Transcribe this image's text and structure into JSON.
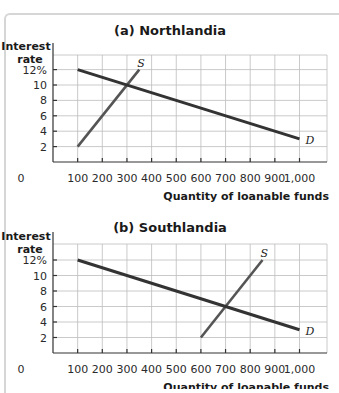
{
  "chart_data": [
    {
      "type": "line",
      "title": "(a) Northlandia",
      "xlabel": "Quantity of loanable funds",
      "ylabel": "Interest rate",
      "xlim": [
        0,
        1050
      ],
      "ylim": [
        0,
        14
      ],
      "x_ticks": [
        "0",
        "100",
        "200",
        "300",
        "400",
        "500",
        "600",
        "700",
        "800",
        "900",
        "1,000"
      ],
      "y_ticks": [
        "2",
        "4",
        "6",
        "8",
        "10",
        "12%"
      ],
      "grid": true,
      "series": [
        {
          "name": "S",
          "label": "S",
          "points": [
            [
              100,
              2
            ],
            [
              350,
              12
            ]
          ],
          "color": "#555555"
        },
        {
          "name": "D",
          "label": "D",
          "points": [
            [
              100,
              12
            ],
            [
              1000,
              3
            ]
          ],
          "color": "#333333"
        }
      ],
      "equilibrium": {
        "x": 300,
        "y": 10
      }
    },
    {
      "type": "line",
      "title": "(b) Southlandia",
      "xlabel": "Quantity of loanable funds",
      "ylabel": "Interest rate",
      "xlim": [
        0,
        1050
      ],
      "ylim": [
        0,
        14
      ],
      "x_ticks": [
        "0",
        "100",
        "200",
        "300",
        "400",
        "500",
        "600",
        "700",
        "800",
        "900",
        "1,000"
      ],
      "y_ticks": [
        "2",
        "4",
        "6",
        "8",
        "10",
        "12%"
      ],
      "grid": true,
      "series": [
        {
          "name": "S",
          "label": "S",
          "points": [
            [
              600,
              2
            ],
            [
              850,
              12
            ]
          ],
          "color": "#555555"
        },
        {
          "name": "D",
          "label": "D",
          "points": [
            [
              100,
              12
            ],
            [
              1000,
              3
            ]
          ],
          "color": "#333333"
        }
      ],
      "equilibrium": {
        "x": 700,
        "y": 6
      }
    }
  ],
  "panels": [
    {
      "title": "(a) Northlandia",
      "ylabel_line1": "Interest",
      "ylabel_line2": "rate",
      "xlabel": "Quantity of loanable funds",
      "origin": "0",
      "s_label": "S",
      "d_label": "D"
    },
    {
      "title": "(b) Southlandia",
      "ylabel_line1": "Interest",
      "ylabel_line2": "rate",
      "xlabel": "Quantity of loanable funds",
      "origin": "0",
      "s_label": "S",
      "d_label": "D"
    }
  ]
}
